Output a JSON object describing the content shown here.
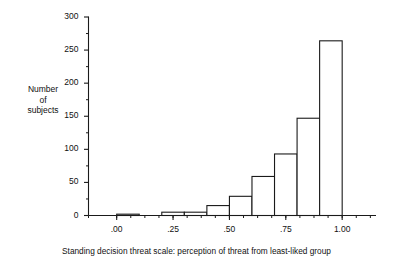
{
  "figure": {
    "y_axis_label": "Number\nof\nsubjects",
    "caption": "Standing decision threat scale: perception of threat from least-liked group"
  },
  "chart_data": {
    "type": "bar",
    "title": "",
    "xlabel": "Standing decision threat scale: perception of threat from least-liked group",
    "ylabel": "Number of subjects",
    "xlim": [
      -0.125,
      1.15
    ],
    "ylim": [
      0,
      300
    ],
    "grid": false,
    "legend": null,
    "bin_width": 0.1,
    "categories": [
      "0.00-0.10",
      "0.10-0.20",
      "0.20-0.30",
      "0.30-0.40",
      "0.40-0.50",
      "0.50-0.60",
      "0.60-0.70",
      "0.70-0.80",
      "0.80-0.90",
      "0.90-1.00"
    ],
    "bin_edges": [
      0.0,
      0.1,
      0.2,
      0.3,
      0.4,
      0.5,
      0.6,
      0.7,
      0.8,
      0.9,
      1.0
    ],
    "values": [
      2,
      0,
      5,
      5,
      15,
      29,
      59,
      93,
      147,
      264
    ],
    "x_ticks_major": [
      0.0,
      0.25,
      0.5,
      0.75,
      1.0
    ],
    "x_tick_labels_major": [
      ".00",
      ".25",
      ".50",
      ".75",
      "1.00"
    ],
    "x_ticks_minor": [
      -0.125,
      0.0,
      0.0625,
      0.125,
      0.1875,
      0.25,
      0.3125,
      0.375,
      0.4375,
      0.5,
      0.5625,
      0.625,
      0.6875,
      0.75,
      0.8125,
      0.875,
      0.9375,
      1.0,
      1.0625,
      1.125
    ],
    "y_ticks_major": [
      0,
      50,
      100,
      150,
      200,
      250,
      300
    ],
    "y_tick_labels_major": [
      "0",
      "50",
      "100",
      "150",
      "200",
      "250",
      "300"
    ],
    "y_ticks_minor": [
      25,
      75,
      125,
      175,
      225,
      275
    ],
    "bar_fill": "#ffffff",
    "bar_stroke": "#1a1a1a",
    "axis_color": "#1a1a1a"
  }
}
